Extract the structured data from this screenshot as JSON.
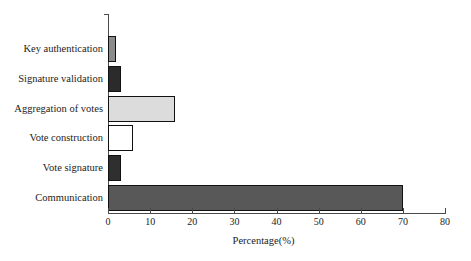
{
  "chart_data": {
    "type": "bar",
    "orientation": "horizontal",
    "title": "",
    "xlabel": "Percentage(%)",
    "ylabel": "",
    "xlim": [
      0,
      80
    ],
    "xticks": [
      0,
      10,
      20,
      30,
      40,
      50,
      60,
      70,
      80
    ],
    "grid": false,
    "legend": null,
    "categories": [
      "Key authentication",
      "Signature validation",
      "Aggregation of votes",
      "Vote construction",
      "Vote signature",
      "Communication"
    ],
    "values": [
      2,
      3,
      16,
      6,
      3,
      70
    ],
    "bar_colors": [
      "#8c8c8c",
      "#2b2b2b",
      "#dcdcdc",
      "#ffffff",
      "#2f2f2f",
      "#585858"
    ],
    "bar_edge_color": "#111111",
    "axis_color": "#4a4a4a",
    "background_color": "#ffffff"
  }
}
